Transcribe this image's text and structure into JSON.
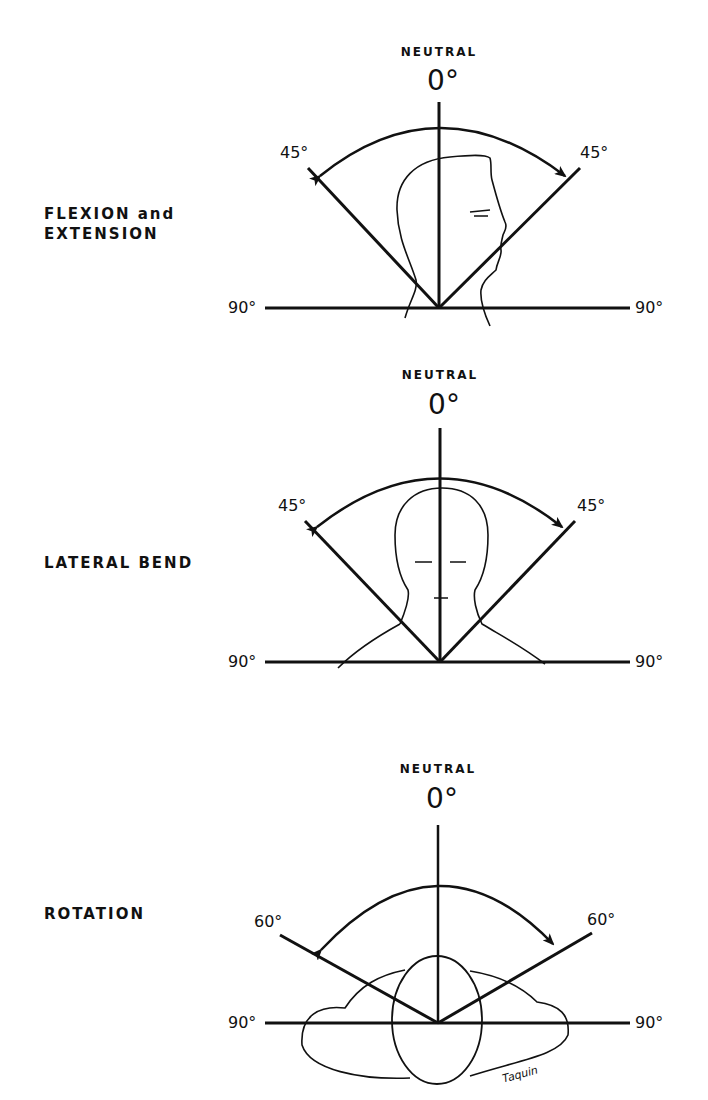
{
  "diagrams": [
    {
      "title_line1": "FLEXION and",
      "title_line2": "EXTENSION",
      "neutral_label": "NEUTRAL",
      "zero_label": "0°",
      "left_angle": "45°",
      "right_angle": "45°",
      "left_end": "90°",
      "right_end": "90°",
      "view": "side profile of head"
    },
    {
      "title_line1": "LATERAL BEND",
      "neutral_label": "NEUTRAL",
      "zero_label": "0°",
      "left_angle": "45°",
      "right_angle": "45°",
      "left_end": "90°",
      "right_end": "90°",
      "view": "front view of head"
    },
    {
      "title_line1": "ROTATION",
      "neutral_label": "NEUTRAL",
      "zero_label": "0°",
      "left_angle": "60°",
      "right_angle": "60°",
      "left_end": "90°",
      "right_end": "90°",
      "view": "top view of head and shoulders"
    }
  ],
  "signature": "Taquin"
}
